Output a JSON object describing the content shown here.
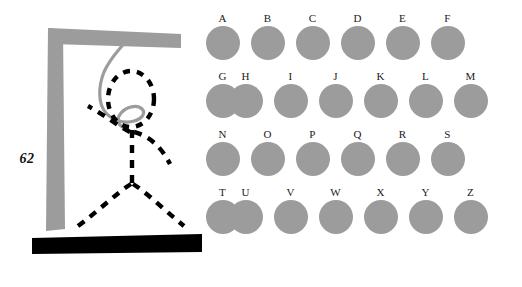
{
  "page": {
    "number": "62",
    "background_color": "#ffffff",
    "width": 522,
    "height": 287
  },
  "illustration": {
    "name": "hangman-gallows",
    "description": "Hangman gallows with dashed stick figure hanging from a gray rope",
    "colors": {
      "post": "#9c9c9c",
      "crossbeam": "#9c9c9c",
      "base": "#000000",
      "rope": "#9c9c9c",
      "figure": "#000000"
    },
    "parts": [
      {
        "name": "vertical-post",
        "color": "#9c9c9c"
      },
      {
        "name": "horizontal-crossbeam",
        "color": "#9c9c9c"
      },
      {
        "name": "ground-base-bar",
        "color": "#000000"
      },
      {
        "name": "hanging-rope",
        "color": "#9c9c9c"
      },
      {
        "name": "figure-head",
        "color": "#000000",
        "style": "dashed-oval"
      },
      {
        "name": "figure-torso",
        "color": "#000000",
        "style": "dashed-line"
      },
      {
        "name": "figure-left-arm",
        "color": "#000000",
        "style": "dashed-curve"
      },
      {
        "name": "figure-right-arm",
        "color": "#000000",
        "style": "dashed-curve"
      },
      {
        "name": "figure-left-leg",
        "color": "#000000",
        "style": "dashed-curve"
      },
      {
        "name": "figure-right-leg",
        "color": "#000000",
        "style": "dashed-curve"
      }
    ]
  },
  "letter_grid": {
    "circle_color": "#9c9c9c",
    "label_color": "#1a1a1a",
    "rows": [
      {
        "indent": false,
        "letters": [
          "A",
          "B",
          "C",
          "D",
          "E",
          "F",
          "G"
        ]
      },
      {
        "indent": true,
        "letters": [
          "H",
          "I",
          "J",
          "K",
          "L",
          "M"
        ]
      },
      {
        "indent": false,
        "letters": [
          "N",
          "O",
          "P",
          "Q",
          "R",
          "S",
          "T"
        ]
      },
      {
        "indent": true,
        "letters": [
          "U",
          "V",
          "W",
          "X",
          "Y",
          "Z"
        ]
      }
    ]
  }
}
